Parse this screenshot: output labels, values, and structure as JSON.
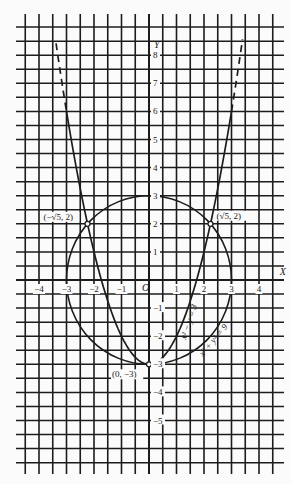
{
  "chart_data": {
    "type": "line",
    "title": "",
    "xlabel": "X",
    "ylabel": "Y",
    "origin_label": "O",
    "xlim": [
      -4.7,
      4.9
    ],
    "ylim": [
      -6.6,
      9.0
    ],
    "grid": true,
    "x_ticks": [
      "-4",
      "-3",
      "-2",
      "-1",
      "1",
      "2",
      "3",
      "4"
    ],
    "y_ticks": [
      "8",
      "7",
      "6",
      "5",
      "4",
      "3",
      "2",
      "1",
      "-1",
      "-2",
      "-3",
      "-4",
      "-5"
    ],
    "series": [
      {
        "name": "x² − y = 3",
        "kind": "parabola",
        "equation": "y = x^2 - 3",
        "x_range": [
          -3.38,
          3.4
        ],
        "dashed_beyond_abs_x": 3.0
      },
      {
        "name": "x² + y² = 9",
        "kind": "circle",
        "center": [
          0,
          0
        ],
        "radius": 3
      }
    ],
    "points": [
      {
        "label": "(−√5, 2)",
        "x": -2.236,
        "y": 2
      },
      {
        "label": "(√5, 2)",
        "x": 2.236,
        "y": 2
      },
      {
        "label": "(0, −3)",
        "x": 0,
        "y": -3
      }
    ],
    "curve_labels": {
      "parabola": "x² − y = 3",
      "circle": "x² + y² = 9"
    }
  },
  "colors": {
    "ink": "#1c1c1c",
    "paper": "#fbfbfb"
  }
}
